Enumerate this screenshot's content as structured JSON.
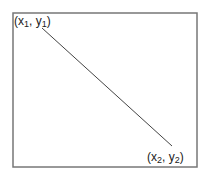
{
  "diagram": {
    "frame": {
      "x": 13,
      "y": 13,
      "width": 184,
      "height": 154,
      "stroke": "#777777"
    },
    "line": {
      "x1": 42,
      "y1": 28,
      "x2": 172,
      "y2": 146,
      "stroke": "#444444"
    },
    "start_label": {
      "open": "(x",
      "sub1": "1",
      "mid": ", y",
      "sub2": "1",
      "close": ")"
    },
    "end_label": {
      "open": "(x",
      "sub1": "2",
      "mid": ", y",
      "sub2": "2",
      "close": ")"
    }
  }
}
